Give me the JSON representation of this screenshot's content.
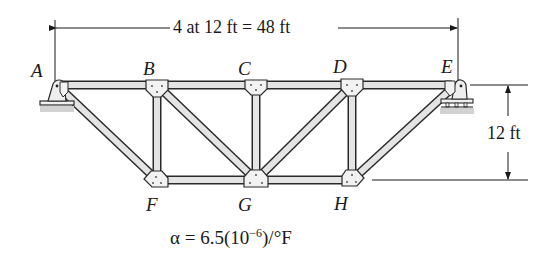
{
  "figure": {
    "type": "truss-diagram",
    "span_dimension": "4 at 12 ft = 48 ft",
    "height_dimension": "12 ft",
    "coefficient": {
      "prefix": "α = 6.5(10",
      "exponent": "−6",
      "suffix": ")/°F"
    },
    "joints": {
      "top": [
        "A",
        "B",
        "C",
        "D",
        "E"
      ],
      "bottom": [
        "F",
        "G",
        "H"
      ]
    },
    "members": [
      [
        "A",
        "B"
      ],
      [
        "B",
        "C"
      ],
      [
        "C",
        "D"
      ],
      [
        "D",
        "E"
      ],
      [
        "F",
        "G"
      ],
      [
        "G",
        "H"
      ],
      [
        "A",
        "F"
      ],
      [
        "B",
        "F"
      ],
      [
        "B",
        "G"
      ],
      [
        "C",
        "G"
      ],
      [
        "D",
        "G"
      ],
      [
        "D",
        "H"
      ],
      [
        "H",
        "E"
      ]
    ],
    "supports": {
      "A": "pin",
      "E": "roller"
    },
    "colors": {
      "line": "#1a1a1a",
      "member_fill": "#e6e6e6",
      "ground": "#cfcfcf"
    }
  }
}
